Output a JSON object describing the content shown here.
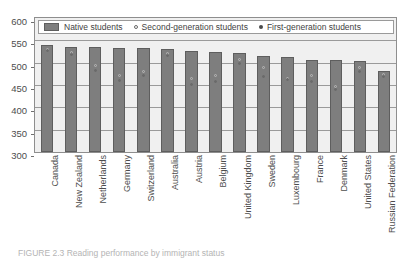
{
  "chart_data": {
    "type": "bar",
    "title": "",
    "xlabel": "",
    "ylabel": "",
    "ylim": [
      300,
      600
    ],
    "ytick_step": 50,
    "yticks": [
      600,
      550,
      500,
      450,
      400,
      350,
      300
    ],
    "grid": true,
    "legend_position": "top-inside",
    "categories": [
      "Canada",
      "New Zealand",
      "Netherlands",
      "Germany",
      "Switzerland",
      "Australia",
      "Austria",
      "Belgium",
      "United Kingdom",
      "Sweden",
      "Luxembourg",
      "France",
      "Denmark",
      "United States",
      "Russian Federation"
    ],
    "series": [
      {
        "name": "Native students",
        "marker": "bar",
        "values": [
          539,
          536,
          535,
          532,
          532,
          530,
          526,
          523,
          521,
          515,
          513,
          507,
          505,
          504,
          481
        ]
      },
      {
        "name": "Second-generation students",
        "marker": "open-circle",
        "values": [
          530,
          522,
          493,
          471,
          480,
          521,
          464,
          471,
          507,
          489,
          465,
          472,
          447,
          489,
          473
        ]
      },
      {
        "name": "First-generation students",
        "marker": "filled-circle",
        "values": [
          527,
          518,
          482,
          460,
          472,
          515,
          452,
          458,
          499,
          470,
          462,
          457,
          440,
          481,
          468
        ]
      }
    ]
  },
  "legend": {
    "entries": [
      {
        "label": "Native students",
        "icon": "square-swatch"
      },
      {
        "label": "Second-generation students",
        "icon": "open-circle-icon"
      },
      {
        "label": "First-generation students",
        "icon": "filled-circle-icon"
      }
    ]
  },
  "caption": {
    "text": "FIGURE 2.3 Reading performance by immigrant status"
  }
}
